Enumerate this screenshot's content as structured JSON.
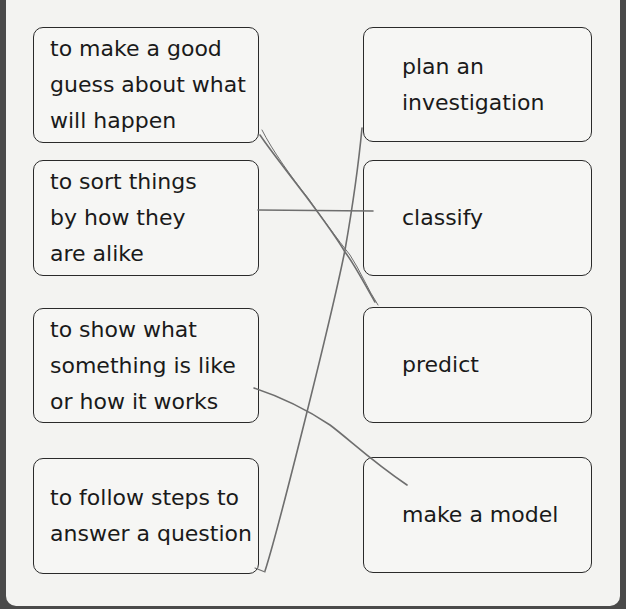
{
  "worksheet": {
    "left_items": [
      {
        "text": "to make a good\nguess about what\nwill happen"
      },
      {
        "text": "to sort things\nby how they\nare alike"
      },
      {
        "text": "to show what\nsomething is like\nor how it works"
      },
      {
        "text": "to follow steps to\nanswer a question"
      }
    ],
    "right_items": [
      {
        "text": "plan an\ninvestigation"
      },
      {
        "text": "classify"
      },
      {
        "text": "predict"
      },
      {
        "text": "make a model"
      }
    ],
    "pencil_matches": [
      {
        "from": "to make a good guess about what will happen",
        "to": "predict"
      },
      {
        "from": "to sort things by how they are alike",
        "to": "classify"
      },
      {
        "from": "to show what something is like or how it works",
        "to": "make a model"
      },
      {
        "from": "to follow steps to answer a question",
        "to": "plan an investigation"
      }
    ],
    "colors": {
      "pencil": "#6e6e6e",
      "border": "#2a2a2a",
      "paper": "#f3f3f1"
    }
  }
}
